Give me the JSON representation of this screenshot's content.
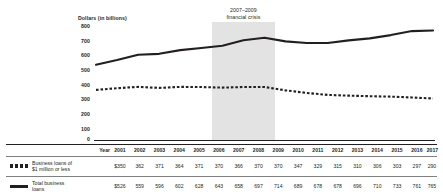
{
  "chart_data": {
    "type": "line",
    "title": "",
    "ylabel": "Dollars (in billions)",
    "xlabel": "Year",
    "ylim": [
      0,
      800
    ],
    "yticks": [
      800,
      700,
      600,
      500,
      400,
      300,
      200,
      100,
      0
    ],
    "grid": false,
    "legend_position": "table-left",
    "categories": [
      "2001",
      "2002",
      "2003",
      "2004",
      "2005",
      "2006",
      "2007",
      "2008",
      "2009",
      "2010",
      "2011",
      "2012",
      "2013",
      "2014",
      "2015",
      "2016",
      "2017"
    ],
    "series": [
      {
        "name": "Business loans of $1 million or less",
        "style": "dotted",
        "values": [
          350,
          362,
          371,
          364,
          371,
          370,
          366,
          370,
          370,
          347,
          329,
          315,
          310,
          306,
          303,
          297,
          290
        ],
        "display_values": [
          "$350",
          "362",
          "371",
          "364",
          "371",
          "370",
          "366",
          "370",
          "370",
          "347",
          "329",
          "315",
          "310",
          "306",
          "303",
          "297",
          "290"
        ]
      },
      {
        "name": "Total business loans",
        "style": "solid",
        "values": [
          526,
          559,
          596,
          602,
          628,
          643,
          658,
          697,
          714,
          689,
          678,
          678,
          696,
          710,
          733,
          761,
          765
        ],
        "display_values": [
          "$526",
          "559",
          "596",
          "602",
          "628",
          "643",
          "658",
          "697",
          "714",
          "689",
          "678",
          "678",
          "696",
          "710",
          "733",
          "761",
          "765"
        ]
      }
    ],
    "annotations": [
      {
        "name": "recession-band",
        "label_line1": "2007–2009",
        "label_line2": "financial crisis",
        "x_start": "2007",
        "x_end": "2009"
      }
    ]
  },
  "table": {
    "year_header": "Year",
    "row_labels": [
      "Business loans of\n$1 million or less",
      "Total business\nloans"
    ],
    "row_label_lines": [
      [
        "Business loans of",
        "$1 million or less"
      ],
      [
        "Total business",
        "loans"
      ]
    ]
  },
  "colors": {
    "ink": "#231f20",
    "band": "#e3e3e3",
    "rule": "#808080"
  }
}
